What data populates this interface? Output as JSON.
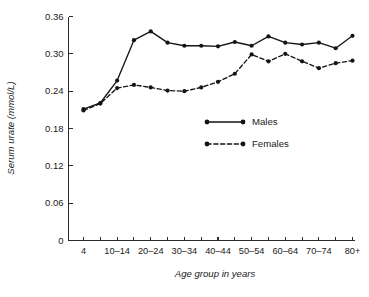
{
  "chart_data": {
    "type": "line",
    "title": "",
    "xlabel": "Age group in years",
    "ylabel": "Serum urate (mmol/L)",
    "ylim": [
      0,
      0.36
    ],
    "yticks": [
      0,
      0.06,
      0.12,
      0.18,
      0.24,
      0.3,
      0.36
    ],
    "ytick_labels": [
      "0",
      "0.06",
      "0.12",
      "0.18",
      "0.24",
      "0.30",
      "0.36"
    ],
    "grid": false,
    "legend_position": "center-right",
    "categories": [
      "4",
      "5-9",
      "10-14",
      "15-19",
      "20-24",
      "25-29",
      "30-34",
      "35-39",
      "40-44",
      "45-49",
      "50-54",
      "55-59",
      "60-64",
      "65-69",
      "70-74",
      "75-79",
      "80+"
    ],
    "xtick_labels": [
      "4",
      "",
      "10–14",
      "",
      "20–24",
      "",
      "30–34",
      "",
      "40–44",
      "",
      "50–54",
      "",
      "60–64",
      "",
      "70–74",
      "",
      "80+"
    ],
    "series": [
      {
        "name": "Males",
        "style": "solid",
        "values": [
          0.211,
          0.221,
          0.257,
          0.322,
          0.336,
          0.318,
          0.313,
          0.313,
          0.312,
          0.319,
          0.313,
          0.328,
          0.318,
          0.315,
          0.318,
          0.309,
          0.329
        ]
      },
      {
        "name": "Females",
        "style": "dashed",
        "values": [
          0.209,
          0.22,
          0.245,
          0.25,
          0.246,
          0.241,
          0.24,
          0.246,
          0.255,
          0.268,
          0.299,
          0.288,
          0.3,
          0.288,
          0.277,
          0.285,
          0.289
        ]
      }
    ]
  },
  "legend": {
    "items": [
      {
        "label": "Males",
        "style": "solid"
      },
      {
        "label": "Females",
        "style": "dashed"
      }
    ]
  },
  "axes": {
    "x_title": "Age group in years",
    "y_title": "Serum urate (mmol/L)"
  }
}
